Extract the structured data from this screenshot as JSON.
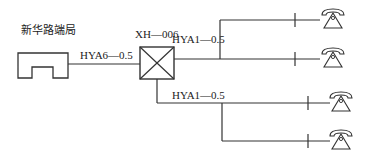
{
  "diagram": {
    "station_label": "新华路端局",
    "junction_label": "XH—006",
    "trunk_cable_label": "HYA6—0.5",
    "upper_branch_cable_label": "HYA1—0.5",
    "lower_branch_cable_label": "HYA1—0.5",
    "line_color": "#333333",
    "terminals": [
      {
        "name": "telephone-1",
        "branch": "upper"
      },
      {
        "name": "telephone-2",
        "branch": "upper"
      },
      {
        "name": "telephone-3",
        "branch": "lower"
      },
      {
        "name": "telephone-4",
        "branch": "lower"
      }
    ]
  }
}
